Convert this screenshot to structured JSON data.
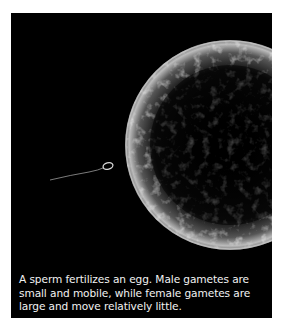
{
  "figure": {
    "image_alt": "Sperm approaching a large egg cell against a black background",
    "caption": "A sperm fertilizes an egg. Male gametes are small and mobile, while female gametes are large and move relatively little.",
    "colors": {
      "background": "#000000",
      "caption_text": "#f2f2f2",
      "page": "#ffffff"
    }
  }
}
